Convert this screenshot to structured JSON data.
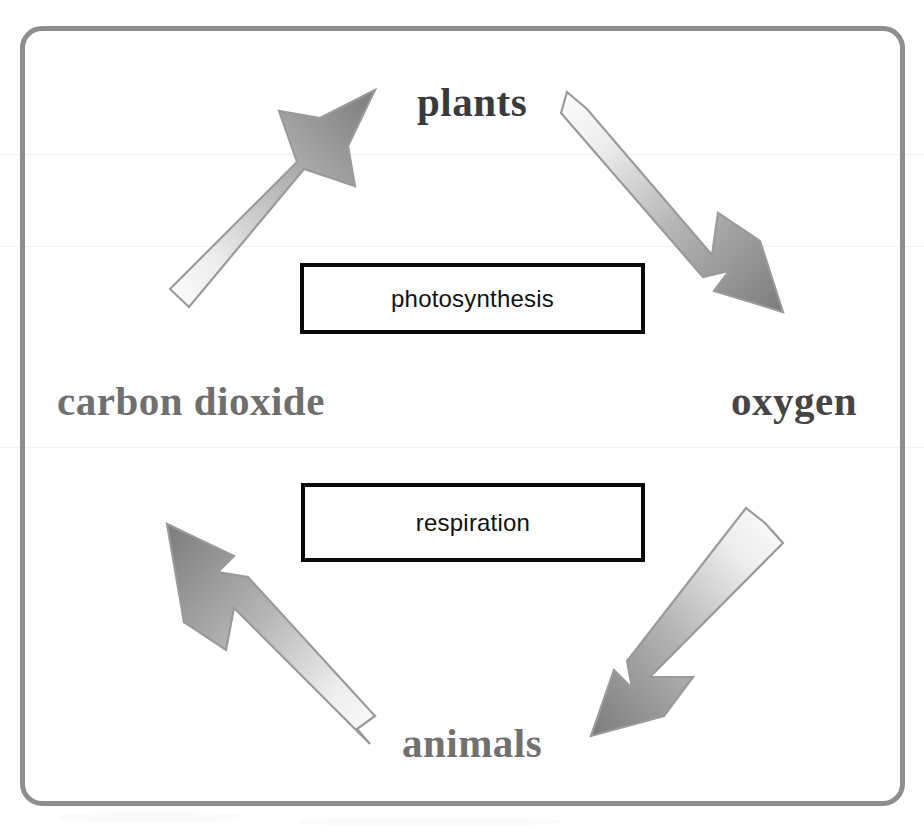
{
  "diagram": {
    "frame": {
      "border_color": "#8e8e8e",
      "background": "#ffffff"
    },
    "nodes": [
      {
        "id": "plants",
        "label": "plants",
        "color": "#3a3a3a"
      },
      {
        "id": "oxygen",
        "label": "oxygen",
        "color": "#454545"
      },
      {
        "id": "animals",
        "label": "animals",
        "color": "#707070"
      },
      {
        "id": "carbon_dioxide",
        "label": "carbon dioxide",
        "color": "#6f6f6f"
      }
    ],
    "processes": [
      {
        "id": "photosynthesis",
        "label": "photosynthesis",
        "border_color": "#0a0a0a",
        "fill": "#ffffff"
      },
      {
        "id": "respiration",
        "label": "respiration",
        "border_color": "#0a0a0a",
        "fill": "#ffffff"
      }
    ],
    "arrows": [
      {
        "id": "co2-to-plants",
        "from": "carbon dioxide",
        "to": "plants",
        "direction": "up-right",
        "process": "photosynthesis",
        "gradient_from": "#fbfbfb",
        "gradient_to": "#7d7d7d",
        "outline": "#9a9a9a"
      },
      {
        "id": "plants-to-oxygen",
        "from": "plants",
        "to": "oxygen",
        "direction": "down-right",
        "process": "photosynthesis",
        "gradient_from": "#fbfbfb",
        "gradient_to": "#7d7d7d",
        "outline": "#9a9a9a"
      },
      {
        "id": "oxygen-to-animals",
        "from": "oxygen",
        "to": "animals",
        "direction": "down-left",
        "process": "respiration",
        "gradient_from": "#fbfbfb",
        "gradient_to": "#7d7d7d",
        "outline": "#9a9a9a"
      },
      {
        "id": "animals-to-co2",
        "from": "animals",
        "to": "carbon dioxide",
        "direction": "up-left",
        "process": "respiration",
        "gradient_from": "#fbfbfb",
        "gradient_to": "#7d7d7d",
        "outline": "#9a9a9a"
      }
    ]
  }
}
